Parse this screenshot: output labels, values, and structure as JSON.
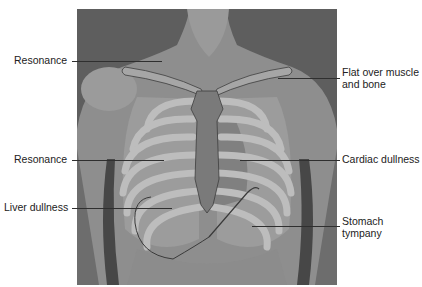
{
  "figure": {
    "labels": {
      "resonance_upper": "Resonance",
      "flat_line1": "Flat over muscle",
      "flat_line2": "and bone",
      "resonance_mid": "Resonance",
      "cardiac": "Cardiac dullness",
      "liver": "Liver dullness",
      "stomach_line1": "Stomach",
      "stomach_line2": "tympany"
    },
    "colors": {
      "background": "#5a5a5a",
      "skin": "#8c8c8c",
      "rib": "#b9b9b9",
      "lung_zone": "#9e9e9e",
      "cardiac_zone": "#7b7b7b",
      "leader_line": "#2f2f2f",
      "text": "#222222"
    }
  }
}
